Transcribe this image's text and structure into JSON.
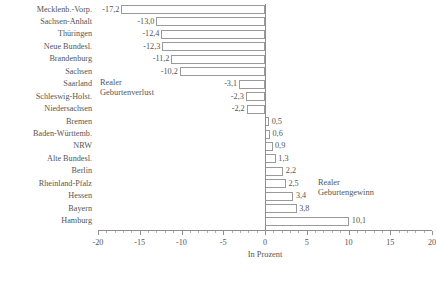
{
  "chart_data": {
    "type": "bar",
    "orientation": "horizontal",
    "title": "",
    "xlabel": "In Prozent",
    "ylabel": "",
    "xlim": [
      -20,
      20
    ],
    "xticks": [
      -20,
      -15,
      -10,
      -5,
      0,
      5,
      10,
      15,
      20
    ],
    "xtick_labels": [
      "-20",
      "-15",
      "-10",
      "-5",
      "0",
      "5",
      "10",
      "15",
      "20"
    ],
    "minor_tick_step": 1,
    "grid": false,
    "legend": "none",
    "categories": [
      "Mecklenb.-Vorp.",
      "Sachsen-Anhalt",
      "Thüringen",
      "Neue Bundesl.",
      "Brandenburg",
      "Sachsen",
      "Saarland",
      "Schleswig-Holst.",
      "Niedersachsen",
      "Bremen",
      "Baden-Württemb.",
      "NRW",
      "Alte Bundesl.",
      "Berlin",
      "Rheinland-Pfalz",
      "Hessen",
      "Bayern",
      "Hamburg"
    ],
    "values": [
      -17.2,
      -13.0,
      -12.4,
      -12.3,
      -11.2,
      -10.2,
      -3.1,
      -2.3,
      -2.2,
      0.5,
      0.6,
      0.9,
      1.3,
      2.2,
      2.5,
      3.4,
      3.8,
      10.1
    ],
    "value_labels": [
      "-17,2",
      "-13,0",
      "-12,4",
      "-12,3",
      "-11,2",
      "-10,2",
      "-3,1",
      "-2,3",
      "-2,2",
      "0,5",
      "0,6",
      "0,9",
      "1,3",
      "2,2",
      "2,5",
      "3,4",
      "3,8",
      "10,1"
    ],
    "annotations": [
      {
        "id": "loss",
        "line1": "Realer",
        "line2": "Geburtenverlust"
      },
      {
        "id": "gain",
        "line1": "Realer",
        "line2": "Geburtengewinn"
      }
    ],
    "colors": {
      "bar_fill": "#ffffff",
      "bar_border": "#9a9a9a",
      "axis": "#8e8e8e",
      "text": "#555555"
    }
  }
}
